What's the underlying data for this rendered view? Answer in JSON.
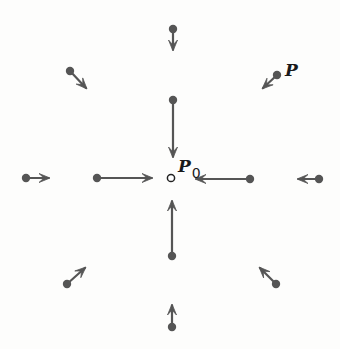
{
  "diagram": {
    "type": "vector-field",
    "colors": {
      "arrow": "#555555",
      "dot": "#555555",
      "center_stroke": "#222222",
      "label": "#1a1a1a",
      "background": "#fdfdfc"
    },
    "center": {
      "name": "P0",
      "x": 171,
      "y": 178
    },
    "labels": [
      {
        "id": "P",
        "text": "P",
        "subscript": "",
        "x": 285,
        "y": 76,
        "size": 17
      },
      {
        "id": "P0",
        "text": "P",
        "subscript": "0",
        "x": 178,
        "y": 172,
        "size": 17
      }
    ],
    "vectors": [
      {
        "id": "top-outer",
        "x1": 173,
        "y1": 29,
        "x2": 173,
        "y2": 51
      },
      {
        "id": "top-inner",
        "x1": 173,
        "y1": 100,
        "x2": 173,
        "y2": 158
      },
      {
        "id": "top-left",
        "x1": 70,
        "y1": 71,
        "x2": 87,
        "y2": 89
      },
      {
        "id": "top-right-P",
        "x1": 277,
        "y1": 75,
        "x2": 262,
        "y2": 89
      },
      {
        "id": "left-outer",
        "x1": 26,
        "y1": 178,
        "x2": 50,
        "y2": 178
      },
      {
        "id": "left-inner",
        "x1": 97,
        "y1": 178,
        "x2": 153,
        "y2": 178
      },
      {
        "id": "right-inner",
        "x1": 250,
        "y1": 179,
        "x2": 195,
        "y2": 179
      },
      {
        "id": "right-outer",
        "x1": 319,
        "y1": 179,
        "x2": 297,
        "y2": 179
      },
      {
        "id": "bottom-inner",
        "x1": 172,
        "y1": 256,
        "x2": 172,
        "y2": 200
      },
      {
        "id": "bottom-outer",
        "x1": 172,
        "y1": 327,
        "x2": 172,
        "y2": 304
      },
      {
        "id": "bottom-left",
        "x1": 67,
        "y1": 284,
        "x2": 86,
        "y2": 267
      },
      {
        "id": "bottom-right",
        "x1": 276,
        "y1": 284,
        "x2": 259,
        "y2": 267
      }
    ]
  }
}
